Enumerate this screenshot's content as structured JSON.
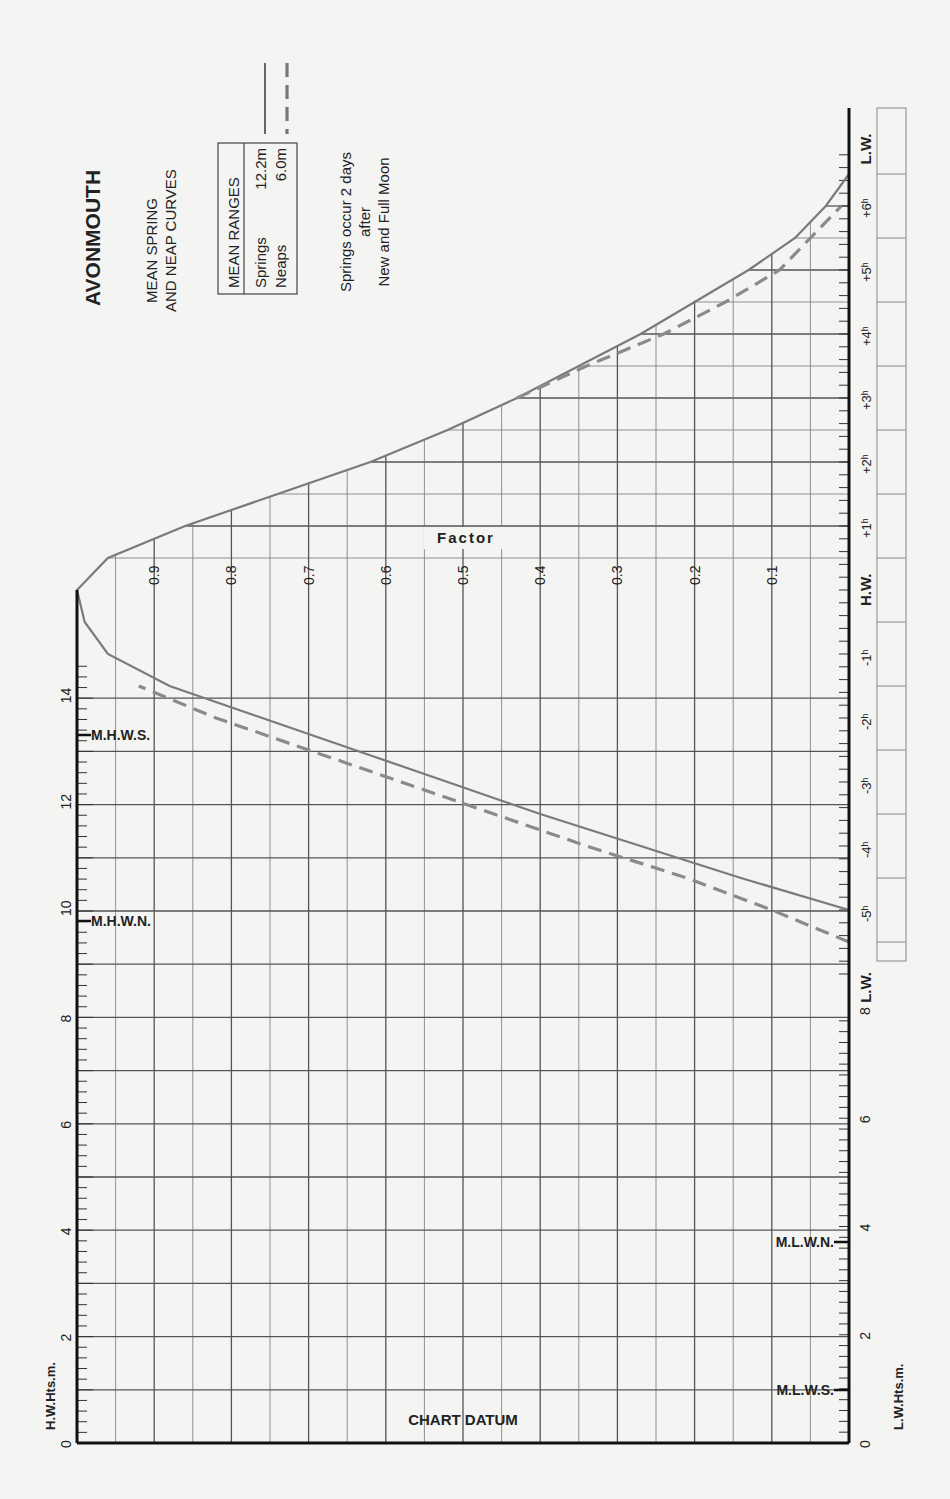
{
  "header": {
    "port": "AVONMOUTH",
    "subtitle_line1": "MEAN SPRING",
    "subtitle_line2": "AND NEAP CURVES",
    "mean_ranges_title": "MEAN RANGES",
    "springs_label": "Springs",
    "springs_value": "12.2m",
    "neaps_label": "Neaps",
    "neaps_value": "6.0m",
    "note_line1": "Springs occur 2 days",
    "note_line2": "after",
    "note_line3": "New and Full Moon"
  },
  "axes": {
    "hw_heights_label": "H.W.Hts.m.",
    "lw_heights_label": "L.W.Hts.m.",
    "factor_label": "Factor",
    "chart_datum_label": "CHART DATUM",
    "hw_height_ticks": [
      "0",
      "2",
      "4",
      "6",
      "8",
      "10",
      "12",
      "14"
    ],
    "lw_height_ticks": [
      "0",
      "2",
      "4",
      "6",
      "8"
    ],
    "factor_ticks": [
      "0.9",
      "0.8",
      "0.7",
      "0.6",
      "0.5",
      "0.4",
      "0.3",
      "0.2",
      "0.1"
    ],
    "time_ticks": [
      "L.W.",
      "-5h",
      "-4h",
      "-3h",
      "-2h",
      "-1h",
      "H.W.",
      "+1h",
      "+2h",
      "+3h",
      "+4h",
      "+5h",
      "+6h",
      "L.W."
    ]
  },
  "levels": {
    "mhws": "M.H.W.S.",
    "mhwn": "M.H.W.N.",
    "mlwn": "M.L.W.N.",
    "mlws": "M.L.W.S."
  },
  "colors": {
    "spring_curve": "#7a7a7a",
    "neap_curve": "#8a8a8a",
    "grid": "#555555",
    "axis": "#111111"
  },
  "chart_data": {
    "type": "line",
    "title": "AVONMOUTH Mean Spring and Neap Curves",
    "xlabel": "Time relative to High Water (hours)",
    "ylabel": "Factor",
    "ylim": [
      0,
      1
    ],
    "xlim": [
      -6,
      7
    ],
    "grid": true,
    "legend": [
      {
        "name": "Springs",
        "style": "solid",
        "range_m": 12.2
      },
      {
        "name": "Neaps",
        "style": "dashed",
        "range_m": 6.0
      }
    ],
    "x": [
      -5.5,
      -5,
      -4.5,
      -4,
      -3.5,
      -3,
      -2.5,
      -2,
      -1.5,
      -1,
      -0.5,
      0,
      0.5,
      1,
      1.5,
      2,
      2.5,
      3,
      3.5,
      4,
      4.5,
      5,
      5.5,
      6,
      6.5
    ],
    "series": [
      {
        "name": "Springs",
        "values": [
          null,
          0.0,
          0.14,
          0.27,
          0.4,
          0.52,
          0.64,
          0.76,
          0.88,
          0.96,
          0.99,
          1.0,
          0.96,
          0.86,
          0.74,
          0.62,
          0.52,
          0.43,
          0.35,
          0.27,
          0.2,
          0.13,
          0.07,
          0.03,
          0.0
        ]
      },
      {
        "name": "Neaps",
        "values": [
          0.0,
          0.1,
          0.21,
          0.34,
          0.46,
          0.58,
          0.7,
          0.82,
          0.92,
          null,
          null,
          null,
          null,
          null,
          null,
          null,
          null,
          0.43,
          0.34,
          0.24,
          0.16,
          0.09,
          0.05,
          0.01,
          null
        ]
      }
    ],
    "hw_height_axis": {
      "label": "H.W.Hts.m.",
      "range": [
        0,
        15
      ],
      "mhws": 13.2,
      "mhwn": 9.8
    },
    "lw_height_axis": {
      "label": "L.W.Hts.m.",
      "range": [
        0,
        9
      ],
      "mlwn": 3.8,
      "mlws": 1.0
    }
  }
}
